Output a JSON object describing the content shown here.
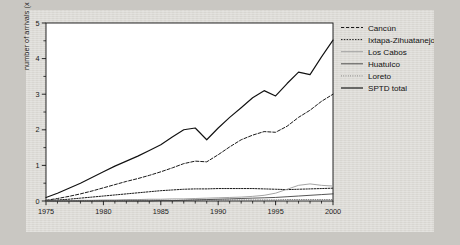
{
  "chart_data": {
    "type": "line",
    "title": "",
    "xlabel": "",
    "ylabel": "number of arrivals (x ,000)",
    "xlim": [
      1975,
      2000
    ],
    "ylim": [
      0,
      5
    ],
    "yticks": [
      0,
      1,
      2,
      3,
      4,
      5
    ],
    "ytick_labels": [
      "0",
      "1",
      "2",
      "3",
      "4",
      "5"
    ],
    "y_minor_step": 0.5,
    "xticks": [
      1975,
      1980,
      1985,
      1990,
      1995,
      2000
    ],
    "xtick_labels": [
      "1975",
      "1980",
      "1985",
      "1990",
      "1995",
      "2000"
    ],
    "x_minor_step": 1,
    "grid": false,
    "legend_position": "right-top",
    "x": [
      1975,
      1976,
      1977,
      1978,
      1979,
      1980,
      1981,
      1982,
      1983,
      1984,
      1985,
      1986,
      1987,
      1988,
      1989,
      1990,
      1991,
      1992,
      1993,
      1994,
      1995,
      1996,
      1997,
      1998,
      1999,
      2000
    ],
    "series": [
      {
        "name": "Cancún",
        "style": "dashed",
        "color": "#1a1a1a",
        "values": [
          0.02,
          0.07,
          0.13,
          0.2,
          0.28,
          0.37,
          0.46,
          0.55,
          0.63,
          0.72,
          0.82,
          0.93,
          1.05,
          1.12,
          1.1,
          1.3,
          1.52,
          1.72,
          1.85,
          1.95,
          1.93,
          2.1,
          2.35,
          2.55,
          2.8,
          3.0
        ]
      },
      {
        "name": "Ixtapa-Zihuatanejo",
        "style": "dotted",
        "color": "#1a1a1a",
        "values": [
          0.01,
          0.03,
          0.05,
          0.08,
          0.11,
          0.14,
          0.17,
          0.2,
          0.23,
          0.26,
          0.29,
          0.31,
          0.33,
          0.34,
          0.34,
          0.35,
          0.35,
          0.35,
          0.35,
          0.34,
          0.33,
          0.32,
          0.33,
          0.34,
          0.35,
          0.36
        ]
      },
      {
        "name": "Los Cabos",
        "style": "solid-light",
        "color": "#9a9a9a",
        "values": [
          0.0,
          0.01,
          0.01,
          0.02,
          0.02,
          0.03,
          0.03,
          0.04,
          0.04,
          0.05,
          0.05,
          0.06,
          0.06,
          0.07,
          0.08,
          0.09,
          0.1,
          0.11,
          0.13,
          0.16,
          0.22,
          0.33,
          0.44,
          0.48,
          0.44,
          0.42
        ]
      },
      {
        "name": "Huatulco",
        "style": "solid-thin",
        "color": "#2b2b2b",
        "values": [
          0.0,
          0.0,
          0.0,
          0.0,
          0.0,
          0.0,
          0.0,
          0.0,
          0.0,
          0.0,
          0.01,
          0.01,
          0.02,
          0.03,
          0.04,
          0.05,
          0.06,
          0.07,
          0.08,
          0.09,
          0.1,
          0.12,
          0.14,
          0.16,
          0.18,
          0.2
        ]
      },
      {
        "name": "Loreto",
        "style": "dotted-fine",
        "color": "#4a4a4a",
        "values": [
          0.0,
          0.0,
          0.0,
          0.01,
          0.01,
          0.01,
          0.01,
          0.02,
          0.02,
          0.02,
          0.02,
          0.02,
          0.02,
          0.03,
          0.03,
          0.03,
          0.03,
          0.03,
          0.03,
          0.03,
          0.03,
          0.04,
          0.04,
          0.04,
          0.04,
          0.04
        ]
      },
      {
        "name": "SPTD total",
        "style": "solid-bold",
        "color": "#111111",
        "values": [
          0.1,
          0.22,
          0.36,
          0.5,
          0.66,
          0.82,
          0.98,
          1.12,
          1.26,
          1.42,
          1.58,
          1.8,
          2.0,
          2.05,
          1.72,
          2.05,
          2.35,
          2.62,
          2.9,
          3.1,
          2.95,
          3.3,
          3.62,
          3.55,
          4.05,
          4.52
        ]
      }
    ]
  },
  "legend": {
    "items": [
      {
        "label": "Cancún"
      },
      {
        "label": "Ixtapa-Zihuatanejo"
      },
      {
        "label": "Los Cabos"
      },
      {
        "label": "Huatulco"
      },
      {
        "label": "Loreto"
      },
      {
        "label": "SPTD total"
      }
    ]
  }
}
